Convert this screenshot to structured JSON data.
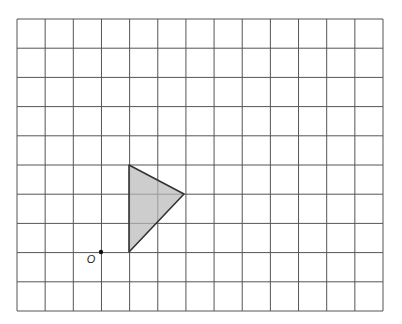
{
  "grid": {
    "left": 17,
    "top": 19,
    "right": 383,
    "bottom": 311,
    "columns": 13,
    "rows": 10,
    "line_color": "#555555"
  },
  "shape": {
    "name": "triangle",
    "fill": "#b8b8b8",
    "fill_opacity": 0.7,
    "stroke": "#333333",
    "vertices_grid": [
      [
        4,
        4
      ],
      [
        6,
        3
      ],
      [
        4,
        1
      ]
    ],
    "vertices_px": [
      [
        129,
        165
      ],
      [
        184,
        194
      ],
      [
        129,
        252
      ]
    ]
  },
  "origin": {
    "label": "O",
    "grid": [
      3,
      1
    ],
    "px": [
      101,
      252
    ],
    "label_px": [
      91,
      263
    ]
  }
}
